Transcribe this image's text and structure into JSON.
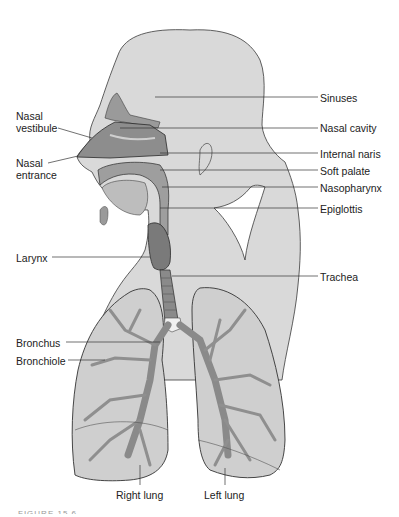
{
  "diagram": {
    "labels_right": [
      {
        "text": "Sinuses",
        "x": 320,
        "y": 92
      },
      {
        "text": "Nasal cavity",
        "x": 320,
        "y": 122
      },
      {
        "text": "Internal naris",
        "x": 320,
        "y": 148
      },
      {
        "text": "Soft palate",
        "x": 320,
        "y": 165
      },
      {
        "text": "Nasopharynx",
        "x": 320,
        "y": 182
      },
      {
        "text": "Epiglottis",
        "x": 320,
        "y": 203
      },
      {
        "text": "Trachea",
        "x": 320,
        "y": 271
      }
    ],
    "labels_left": [
      {
        "text": "Nasal vestibule",
        "line1": "Nasal",
        "line2": "vestibule",
        "x": 16,
        "y": 110
      },
      {
        "text": "Nasal entrance",
        "line1": "Nasal",
        "line2": "entrance",
        "x": 16,
        "y": 157
      },
      {
        "text": "Larynx",
        "x": 16,
        "y": 253
      },
      {
        "text": "Bronchus",
        "x": 16,
        "y": 337
      },
      {
        "text": "Bronchiole",
        "x": 16,
        "y": 355
      }
    ],
    "labels_bottom": [
      {
        "text": "Right lung",
        "x": 116,
        "y": 489
      },
      {
        "text": "Left lung",
        "x": 204,
        "y": 489
      }
    ],
    "caption": "FIGURE 15.6",
    "colors": {
      "body_fill": "#d9d9d9",
      "body_outline": "#3a3a3a",
      "airway_dark": "#7a7a7a",
      "airway_mid": "#a8a8a8",
      "lung_fill": "#cfcfcf",
      "lung_light": "#ececec",
      "leader_line": "#333333"
    }
  }
}
